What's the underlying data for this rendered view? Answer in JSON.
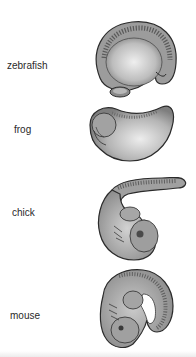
{
  "figure": {
    "labels": [
      {
        "name": "zebrafish"
      },
      {
        "name": "frog"
      },
      {
        "name": "chick"
      },
      {
        "name": "mouse"
      }
    ],
    "colors": {
      "background": "#ffffff",
      "embryo_fill": "#a8a8a8",
      "embryo_highlight": "#e4e4e4",
      "outline": "#2b2b2b",
      "label_text": "#2a2a2a"
    }
  }
}
